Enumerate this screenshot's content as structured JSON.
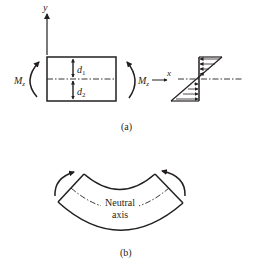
{
  "figure": {
    "panel_a": {
      "caption": "(a)",
      "y_axis_label": "y",
      "x_axis_label": "x",
      "moment_left_label": "M",
      "moment_left_sub": "z",
      "moment_right_label": "M",
      "moment_right_sub": "z",
      "d1_label": "d",
      "d1_sub": "1",
      "d2_label": "d",
      "d2_sub": "2",
      "cross_section": "rectangular beam section with neutral axis (dash-dot)",
      "stress_diagram": "linear bending stress distribution: compression above neutral axis, tension below"
    },
    "panel_b": {
      "caption": "(b)",
      "neutral_axis_label_line1": "Neutral",
      "neutral_axis_label_line2": "axis",
      "description": "bent beam segment under end moments"
    },
    "colors": {
      "line": "#231f20",
      "background": "#ffffff"
    }
  }
}
